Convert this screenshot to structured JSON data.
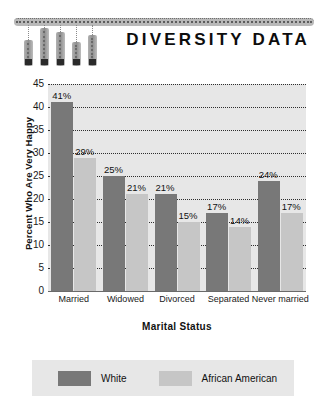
{
  "header": {
    "title": "DIVERSITY DATA",
    "logo_name": "diversity-data-logo",
    "logo_bars": [
      {
        "height": 26,
        "top": 22,
        "left": 10
      },
      {
        "height": 38,
        "top": 10,
        "left": 26
      },
      {
        "height": 34,
        "top": 14,
        "left": 42
      },
      {
        "height": 24,
        "top": 24,
        "left": 58
      },
      {
        "height": 31,
        "top": 17,
        "left": 74
      }
    ]
  },
  "chart_data": {
    "type": "bar",
    "title": "DIVERSITY DATA",
    "xlabel": "Marital Status",
    "ylabel": "Percent Who Are Very Happy",
    "categories": [
      "Married",
      "Widowed",
      "Divorced",
      "Separated",
      "Never married"
    ],
    "series": [
      {
        "name": "White",
        "color": "#787878",
        "values": [
          41,
          25,
          21,
          17,
          24
        ]
      },
      {
        "name": "African American",
        "color": "#c6c6c6",
        "values": [
          29,
          21,
          15,
          14,
          17
        ]
      }
    ],
    "value_labels": [
      [
        "41%",
        "29%"
      ],
      [
        "25%",
        "21%"
      ],
      [
        "21%",
        "15%"
      ],
      [
        "17%",
        "14%"
      ],
      [
        "24%",
        "17%"
      ]
    ],
    "ylim": [
      0,
      45
    ],
    "yticks": [
      45,
      40,
      35,
      30,
      25,
      20,
      15,
      10,
      5,
      0
    ],
    "grid": true,
    "grid_style": "dotted",
    "legend_position": "bottom",
    "plot_background": "#e7e7e7"
  },
  "legend": {
    "items": [
      {
        "label": "White",
        "color": "#787878"
      },
      {
        "label": "African American",
        "color": "#c6c6c6"
      }
    ]
  }
}
